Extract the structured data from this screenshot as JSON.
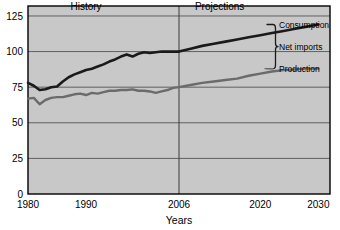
{
  "chart_data": {
    "type": "line",
    "title": "",
    "xlabel": "Years",
    "ylabel": "",
    "grid": true,
    "legend_position": "right-inline",
    "xlim": [
      1980,
      2032
    ],
    "ylim": [
      0,
      132
    ],
    "xticks": [
      "1980",
      "1990",
      "2006",
      "2020",
      "2030"
    ],
    "xtick_values": [
      1980,
      1990,
      2006,
      2020,
      2030
    ],
    "yticks": [
      "0",
      "25",
      "50",
      "75",
      "100",
      "125"
    ],
    "ytick_values": [
      0,
      25,
      50,
      75,
      100,
      125
    ],
    "annotations": [
      {
        "text": "History",
        "x": 1990,
        "y": 129
      },
      {
        "text": "Projections",
        "x": 2013,
        "y": 129
      }
    ],
    "divider": {
      "x": 2006,
      "label": "2006"
    },
    "series": [
      {
        "name": "Consumption",
        "color": "#1a1a1a",
        "width": 2.6,
        "x": [
          1980,
          1981,
          1982,
          1983,
          1984,
          1985,
          1986,
          1987,
          1988,
          1989,
          1990,
          1991,
          1992,
          1993,
          1994,
          1995,
          1996,
          1997,
          1998,
          1999,
          2000,
          2001,
          2002,
          2003,
          2004,
          2005,
          2006,
          2008,
          2010,
          2012,
          2014,
          2016,
          2018,
          2020,
          2022,
          2024,
          2026,
          2028,
          2030
        ],
        "values": [
          78,
          76,
          73,
          73.5,
          75,
          75.5,
          79,
          82,
          84,
          85.5,
          87,
          88,
          89.5,
          91,
          93,
          94.5,
          96.5,
          98,
          96.5,
          98.5,
          99.5,
          99,
          99.5,
          100,
          100,
          100,
          100,
          102,
          104,
          105.5,
          107,
          108.5,
          110,
          111.5,
          113,
          114.5,
          116,
          117.5,
          119
        ]
      },
      {
        "name": "Production",
        "color": "#6b6b6b",
        "width": 2.4,
        "x": [
          1980,
          1981,
          1982,
          1983,
          1984,
          1985,
          1986,
          1987,
          1988,
          1989,
          1990,
          1991,
          1992,
          1993,
          1994,
          1995,
          1996,
          1997,
          1998,
          1999,
          2000,
          2001,
          2002,
          2003,
          2004,
          2005,
          2006,
          2008,
          2010,
          2012,
          2014,
          2016,
          2018,
          2020,
          2022,
          2024,
          2026,
          2028,
          2030
        ],
        "values": [
          67,
          67.5,
          63,
          66,
          67.5,
          68,
          68,
          69,
          70,
          70.5,
          69.5,
          71,
          70.5,
          71.5,
          72.5,
          72.5,
          73,
          73,
          73.5,
          72.5,
          72.5,
          72,
          71,
          72,
          73,
          74.5,
          75,
          76.5,
          78,
          79,
          80,
          81,
          83,
          84.5,
          86,
          87,
          87.5,
          88,
          88
        ]
      }
    ],
    "series_labels": [
      {
        "name": "Consumption",
        "text": "Consumption",
        "y_value": 119
      },
      {
        "name": "Net imports",
        "text": "Net imports",
        "y_value": 103.5
      },
      {
        "name": "Production",
        "text": "Production",
        "y_value": 88
      }
    ],
    "colors": {
      "plot_background": "#c8c8c8",
      "frame": "#000000",
      "gridline": "#555555",
      "page_background": "#ffffff",
      "consumption": "#1a1a1a",
      "production": "#6b6b6b"
    }
  }
}
